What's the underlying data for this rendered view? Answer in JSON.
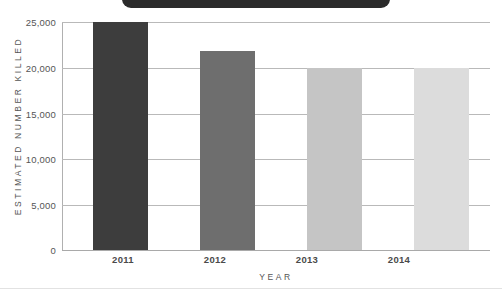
{
  "title_banner": {
    "text": "",
    "color": "#2b2b2b",
    "cropped": true
  },
  "chart_data": {
    "type": "bar",
    "title": "",
    "xlabel": "YEAR",
    "ylabel": "ESTIMATED NUMBER KILLED",
    "categories": [
      "2011",
      "2012",
      "2013",
      "2014"
    ],
    "values": [
      25000,
      21800,
      20000,
      20000
    ],
    "value_labels": [
      "25,000",
      "21,800",
      "20,000",
      "20,000"
    ],
    "bar_colors": [
      "#3d3d3d",
      "#6e6e6e",
      "#c5c5c5",
      "#dcdcdc"
    ],
    "ylim": [
      0,
      25000
    ],
    "yticks": [
      0,
      5000,
      10000,
      15000,
      20000,
      25000
    ],
    "ytick_labels": [
      "0",
      "5,000",
      "10,000",
      "15,000",
      "20,000",
      "25,000"
    ],
    "grid": true,
    "legend": "none"
  },
  "axes": {
    "y_title": "ESTIMATED NUMBER KILLED",
    "x_title": "YEAR",
    "y_labels": {
      "t0": "0",
      "t1": "5,000",
      "t2": "10,000",
      "t3": "15,000",
      "t4": "20,000",
      "t5": "25,000"
    },
    "x_labels": {
      "c0": "2011",
      "c1": "2012",
      "c2": "2013",
      "c3": "2014"
    }
  },
  "colors": {
    "gridline": "#b9b9b9",
    "axis": "#b0b0b0",
    "text": "#4a4a4a",
    "background": "#ffffff"
  }
}
